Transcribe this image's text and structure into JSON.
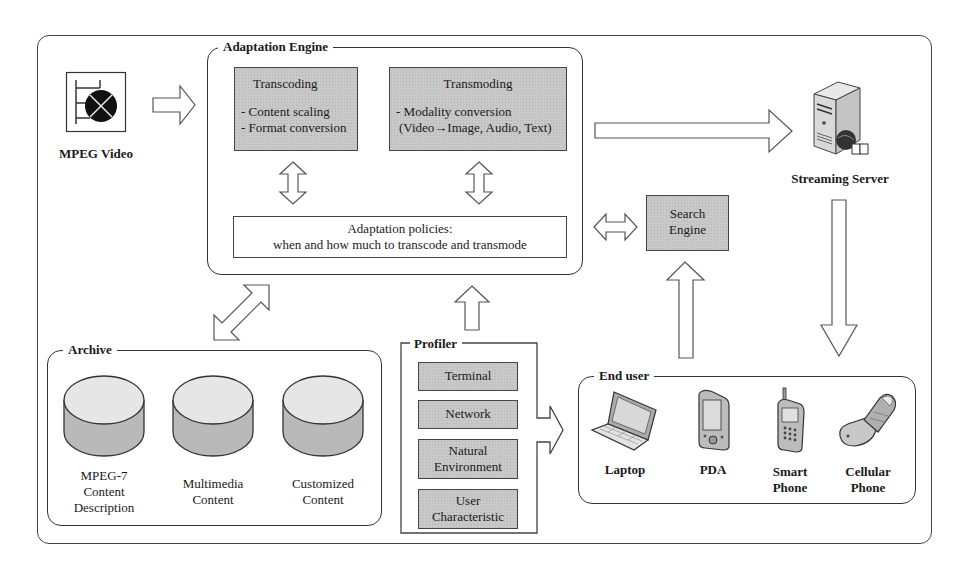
{
  "diagram": {
    "sources": {
      "mpeg_video": {
        "label": "MPEG Video",
        "icon": "video-film-icon"
      }
    },
    "adaptation_engine": {
      "title": "Adaptation Engine",
      "transcoding": {
        "title": "Transcoding",
        "items": [
          "- Content scaling",
          "- Format conversion"
        ]
      },
      "transmoding": {
        "title": "Transmoding",
        "items": [
          "- Modality conversion",
          "(Video→Image, Audio, Text)"
        ]
      },
      "policies": {
        "line1": "Adaptation policies:",
        "line2": "when and how much to transcode and transmode"
      }
    },
    "search_engine": {
      "line1": "Search",
      "line2": "Engine"
    },
    "streaming_server": {
      "label": "Streaming Server",
      "icon": "server-icon"
    },
    "archive": {
      "title": "Archive",
      "stores": [
        {
          "lines": [
            "MPEG-7",
            "Content",
            "Description"
          ],
          "icon": "database-icon"
        },
        {
          "lines": [
            "Multimedia",
            "Content"
          ],
          "icon": "database-icon"
        },
        {
          "lines": [
            "Customized",
            "Content"
          ],
          "icon": "database-icon"
        }
      ]
    },
    "profiler": {
      "title": "Profiler",
      "items": [
        {
          "lines": [
            "Terminal"
          ]
        },
        {
          "lines": [
            "Network"
          ]
        },
        {
          "lines": [
            "Natural",
            "Environment"
          ]
        },
        {
          "lines": [
            "User",
            "Characteristic"
          ]
        }
      ]
    },
    "end_user": {
      "title": "End user",
      "devices": [
        {
          "lines": [
            "Laptop"
          ],
          "icon": "laptop-icon"
        },
        {
          "lines": [
            "PDA"
          ],
          "icon": "pda-icon"
        },
        {
          "lines": [
            "Smart",
            "Phone"
          ],
          "icon": "smartphone-icon"
        },
        {
          "lines": [
            "Cellular",
            "Phone"
          ],
          "icon": "flip-phone-icon"
        }
      ]
    },
    "colors": {
      "module_fill": "#c8c8c8",
      "outline": "#444444",
      "background": "#ffffff"
    }
  }
}
